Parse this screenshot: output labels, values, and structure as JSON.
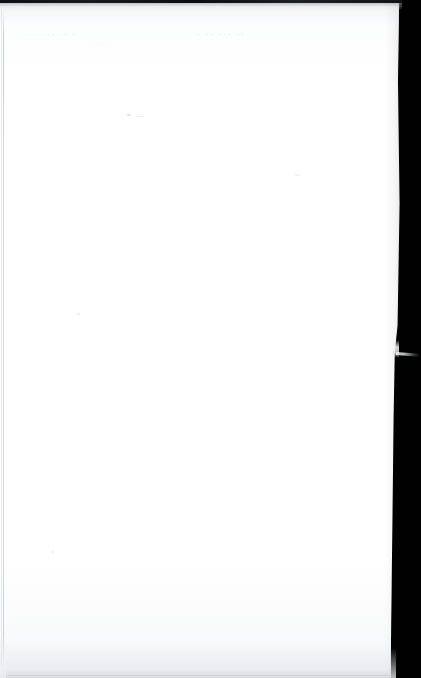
{
  "page": {
    "kind": "scanned-document-page",
    "appearance": "blank",
    "width": 421,
    "height": 678,
    "paper_color": "#ffffff",
    "background_color": "#010101",
    "shadow_color": "#c6c8cb"
  },
  "scan": {
    "top_strip_label": "",
    "top_strip_color": "#111315",
    "left_rule_color": "#c6c8cb",
    "edge_note": "",
    "page_edge_top_x": 399,
    "page_edge_bottom_x": 391
  },
  "content": {
    "body_text": "",
    "header_text": "",
    "footer_text": "",
    "page_number": ""
  },
  "ghost_text": {
    "note": "show-through from reverse side, illegible",
    "line_1": "· ··  ···   ·  ·",
    "line_2": "··  ···  ·· ·",
    "line_3": "·   ·· ·"
  },
  "artifacts": {
    "speck_label": "",
    "fiber_label": "",
    "fiber_y": 352
  }
}
